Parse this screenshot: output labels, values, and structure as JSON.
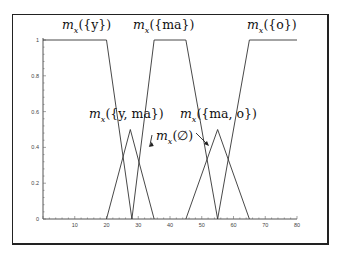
{
  "chart_data": {
    "type": "line",
    "title": "",
    "xlabel": "",
    "ylabel": "",
    "xlim": [
      0,
      80
    ],
    "ylim": [
      0,
      1
    ],
    "x_ticks": [
      "10",
      "20",
      "30",
      "40",
      "50",
      "60",
      "70",
      "80"
    ],
    "y_ticks": [
      "0",
      "0.2",
      "0.4",
      "0.6",
      "0.8",
      "1"
    ],
    "grid": false,
    "legend": "none",
    "series": [
      {
        "name": "m_x({y})",
        "points": [
          [
            0,
            1
          ],
          [
            20,
            1
          ],
          [
            28,
            0
          ]
        ]
      },
      {
        "name": "m_x({ma})",
        "points": [
          [
            28,
            0
          ],
          [
            35,
            1
          ],
          [
            45,
            1
          ],
          [
            55,
            0
          ]
        ]
      },
      {
        "name": "m_x({o})",
        "points": [
          [
            55,
            0
          ],
          [
            65,
            1
          ],
          [
            80,
            1
          ]
        ]
      },
      {
        "name": "m_x({y,ma})",
        "points": [
          [
            20,
            0
          ],
          [
            27.5,
            0.5
          ],
          [
            35,
            0
          ]
        ]
      },
      {
        "name": "m_x({ma,o})",
        "points": [
          [
            45,
            0
          ],
          [
            55,
            0.5
          ],
          [
            65,
            0
          ]
        ]
      }
    ],
    "annotations": [
      {
        "text": "m_x({y})",
        "x": 10,
        "y": 1.05
      },
      {
        "text": "m_x({ma})",
        "x": 40,
        "y": 1.05
      },
      {
        "text": "m_x({o})",
        "x": 70,
        "y": 1.05
      },
      {
        "text": "m_x({y,ma})",
        "x": 27,
        "y": 0.6
      },
      {
        "text": "m_x({ma,o})",
        "x": 55,
        "y": 0.6
      },
      {
        "text": "m_x(∅)",
        "x": 44,
        "y": 0.44,
        "arrows_to": [
          [
            33,
            0.4
          ],
          [
            52,
            0.4
          ]
        ]
      }
    ]
  },
  "labels": {
    "y": "m",
    "y_sub": "x",
    "y_arg": "({y})",
    "ma_arg": "({ma})",
    "o_arg": "({o})",
    "yma_arg": "({y, ma})",
    "mao_arg": "({ma, o})",
    "empty_arg": "(∅)"
  },
  "axis": {
    "x_ticks": [
      "10",
      "20",
      "30",
      "40",
      "50",
      "60",
      "70",
      "80"
    ],
    "y_ticks": [
      "0",
      "0.2",
      "0.4",
      "0.6",
      "0.8",
      "1"
    ]
  }
}
